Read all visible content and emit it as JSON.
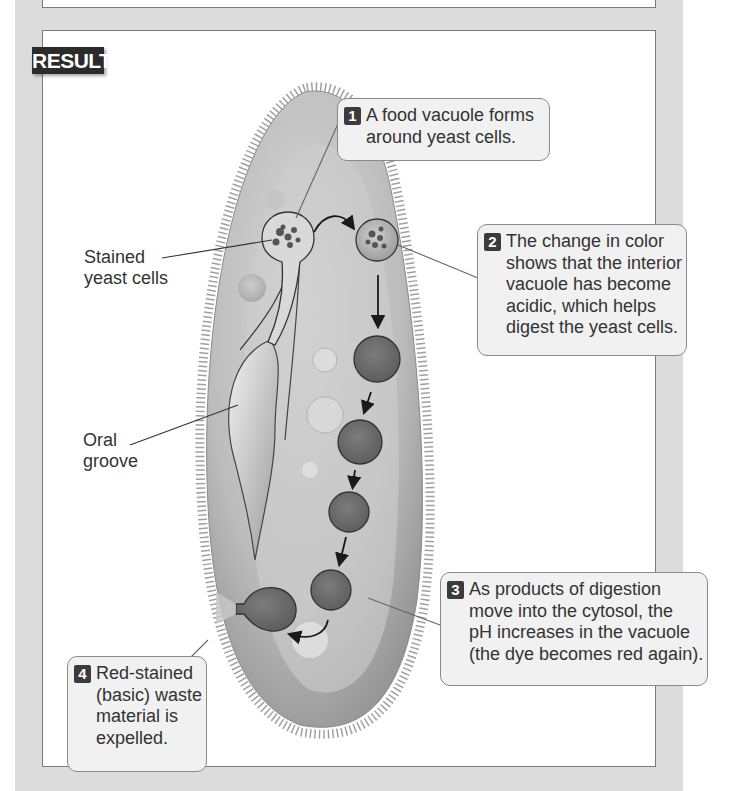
{
  "header": {
    "results_badge": "RESULTS"
  },
  "labels": {
    "stained_yeast": [
      "Stained",
      "yeast cells"
    ],
    "oral_groove": [
      "Oral",
      "groove"
    ]
  },
  "callouts": [
    {
      "number": "1",
      "lines": [
        "A food vacuole forms",
        "around yeast cells."
      ]
    },
    {
      "number": "2",
      "lines": [
        "The change in color",
        "shows that the interior",
        "vacuole has become",
        "acidic, which helps",
        "digest the yeast cells."
      ]
    },
    {
      "number": "3",
      "lines": [
        "As products of digestion",
        "move into the cytosol, the",
        "pH increases in the vacuole",
        "(the dye becomes red again)."
      ]
    },
    {
      "number": "4",
      "lines": [
        "Red-stained",
        "(basic) waste",
        "material is",
        "expelled."
      ]
    }
  ],
  "colors": {
    "frame": "#dcdcdc",
    "panel_border": "#7a7a7a",
    "badge_bg": "#2b2b2b",
    "callout_bg": "#f1f1f1",
    "cell_body": "#b5b5b5",
    "vacuole_dark": "#6e6e6e"
  }
}
